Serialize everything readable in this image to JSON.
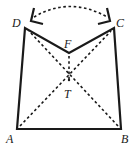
{
  "diagram": {
    "type": "geometry-folding",
    "points": {
      "A": {
        "label": "A"
      },
      "B": {
        "label": "B"
      },
      "C": {
        "label": "C"
      },
      "D": {
        "label": "D"
      },
      "F": {
        "label": "F"
      },
      "T": {
        "label": "T"
      }
    },
    "solid_segments": [
      "AB",
      "BC",
      "CF",
      "FD",
      "DA"
    ],
    "dashed_segments": [
      "AC",
      "BD",
      "FT"
    ],
    "annotation": "curved dashed double-headed arrow indicating folding of D and C together",
    "colors": {
      "stroke": "#1a1a1a",
      "background": "#ffffff"
    }
  }
}
